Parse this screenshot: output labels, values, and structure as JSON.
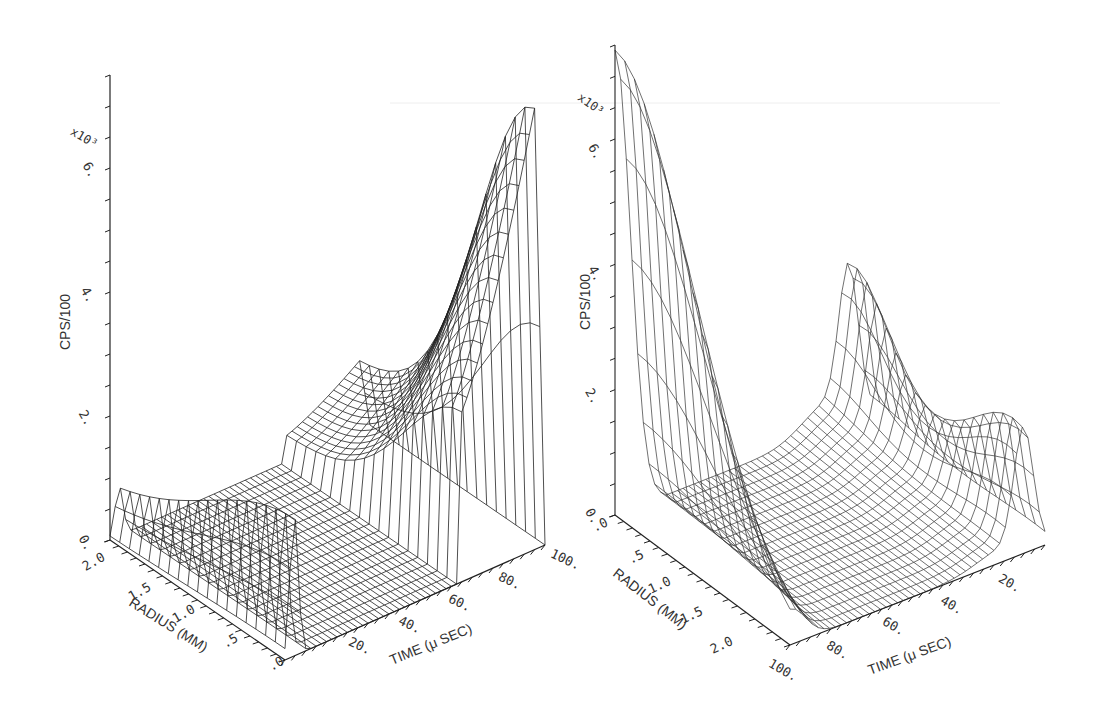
{
  "chart_data": [
    {
      "type": "surface3d",
      "panel": "left",
      "title": "",
      "zlabel": "CPS/100",
      "zscale_label": "x10³",
      "z_ticks": [
        "0.",
        "2.",
        "4.",
        "6."
      ],
      "z_tick_values": [
        0,
        2000,
        4000,
        6000
      ],
      "zlim": [
        0,
        7500
      ],
      "xlabel": "RADIUS (MM)",
      "x_ticks": [
        "2.0",
        "1.5",
        "1.0",
        ".5",
        ".0"
      ],
      "x_tick_values": [
        2.0,
        1.5,
        1.0,
        0.5,
        0.0
      ],
      "ylabel": "TIME (μ SEC)",
      "y_ticks": [
        "20.",
        "40.",
        "60.",
        "80.",
        "100."
      ],
      "y_tick_values": [
        20,
        40,
        60,
        80,
        100
      ],
      "grid": false,
      "description": "Wireframe surface: small peak (~2200 CPS/100) near time 0 across radius, flat floor from time 10-75, large rising ridge peaking ~7000 at time ~95 near radius 0",
      "profiles_along_time_at_radius_0": {
        "time": [
          0,
          5,
          10,
          20,
          30,
          40,
          50,
          60,
          65,
          70,
          75,
          80,
          85,
          90,
          95,
          100
        ],
        "values": [
          0,
          2200,
          500,
          0,
          0,
          0,
          0,
          0,
          100,
          2800,
          3600,
          4300,
          5300,
          6300,
          7000,
          0
        ]
      }
    },
    {
      "type": "surface3d",
      "panel": "right",
      "title": "",
      "zlabel": "CPS/100",
      "zscale_label": "x10³",
      "z_ticks": [
        "0.",
        "2.",
        "4.",
        "6."
      ],
      "z_tick_values": [
        0,
        2000,
        4000,
        6000
      ],
      "zlim": [
        0,
        7500
      ],
      "xlabel": "RADIUS (MM)",
      "x_ticks": [
        ".0",
        ".5",
        "1.0",
        "1.5",
        "2.0"
      ],
      "x_tick_values": [
        0.0,
        0.5,
        1.0,
        1.5,
        2.0
      ],
      "ylabel": "TIME (μ SEC)",
      "y_ticks": [
        "100.",
        "80.",
        "60.",
        "40.",
        "20."
      ],
      "y_tick_values": [
        100,
        80,
        60,
        40,
        20
      ],
      "grid": false,
      "description": "Wireframe surface viewed from reverse time direction: tall ridge ~7500 at time ~100 near radius 0 decaying with radius, flat floor, second peak ~2300 near time ~15 with saddle",
      "profiles_along_time_at_radius_0": {
        "time": [
          100,
          95,
          90,
          85,
          80,
          60,
          40,
          30,
          25,
          20,
          15,
          10,
          5
        ],
        "values": [
          7500,
          6500,
          4500,
          1500,
          0,
          0,
          0,
          600,
          1500,
          1800,
          2300,
          800,
          0
        ]
      }
    }
  ],
  "figure": {
    "left_panel": {
      "zlabel": "CPS/100",
      "zscale": "x10³",
      "radius_label": "RADIUS (MM)",
      "time_label": "TIME (μ SEC)",
      "z_ticks": [
        "0.",
        "2.",
        "4.",
        "6."
      ],
      "radius_ticks": [
        "2.0",
        "1.5",
        "1.0",
        ".5",
        ".0"
      ],
      "time_ticks": [
        "20.",
        "40.",
        "60.",
        "80.",
        "100."
      ]
    },
    "right_panel": {
      "zlabel": "CPS/100",
      "zscale": "x10³",
      "radius_label": "RADIUS (MM)",
      "time_label": "TIME (μ SEC)",
      "z_ticks": [
        "0.",
        "2.",
        "4.",
        "6."
      ],
      "radius_ticks": [
        ".0",
        ".5",
        "1.0",
        "1.5",
        "2.0"
      ],
      "time_ticks": [
        "100.",
        "80.",
        "60.",
        "40.",
        "20."
      ]
    },
    "colors": {
      "background": "#ffffff",
      "ink": "#222222",
      "label": "#444444"
    }
  }
}
